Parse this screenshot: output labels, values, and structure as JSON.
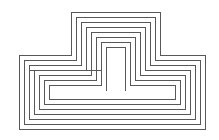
{
  "figure": {
    "type": "line-drawing",
    "width": 219,
    "height": 140,
    "background_color": "#ffffff",
    "stroke_color": "#58585a",
    "stroke_width": 1
  },
  "chart_data": {
    "type": "line",
    "xlabel": "",
    "ylabel": "",
    "xlim": [
      0,
      219
    ],
    "ylim": [
      0,
      140
    ],
    "grid": false,
    "legend": "none",
    "series": [
      {
        "name": "contour-1-outermost",
        "points": "M 19 55 L 19 129 L 205 129 L 205 55 L 160 55 L 160 12 L 71 12 L 71 55 Z"
      },
      {
        "name": "contour-2",
        "points": "M 24 60 L 24 124 L 200 124 L 200 60 L 155 60 L 155 17 L 76 17 L 76 60 Z"
      },
      {
        "name": "contour-3",
        "points": "M 29 65 L 29 119 L 195 119 L 195 65 L 150 65 L 150 22 L 81 22 L 81 65 Z"
      },
      {
        "name": "contour-4",
        "points": "M 34 70 L 34 114 L 190 114 L 190 70 L 145 70 L 145 27 L 86 27 L 86 70 Z"
      },
      {
        "name": "contour-5",
        "points": "M 39 75 L 39 109 L 185 109 L 185 75 L 140 75 L 140 32 L 91 32 L 91 75 Z"
      },
      {
        "name": "contour-6",
        "points": "M 44 80 L 44 104 L 180 104 L 180 80 L 135 80 L 135 37 L 96 37 L 96 80 Z"
      },
      {
        "name": "contour-7-inner-bar",
        "points": "M 49 85 L 49 99 L 175 99 L 175 85 L 130 85 L 130 42 L 101 42 L 101 85 Z"
      },
      {
        "name": "contour-8-center-pi",
        "points": "M 106 90 L 106 47 L 125 47 L 125 90"
      },
      {
        "name": "connector-left-horizontal",
        "points": "M 29 70 L 101 70"
      }
    ]
  }
}
